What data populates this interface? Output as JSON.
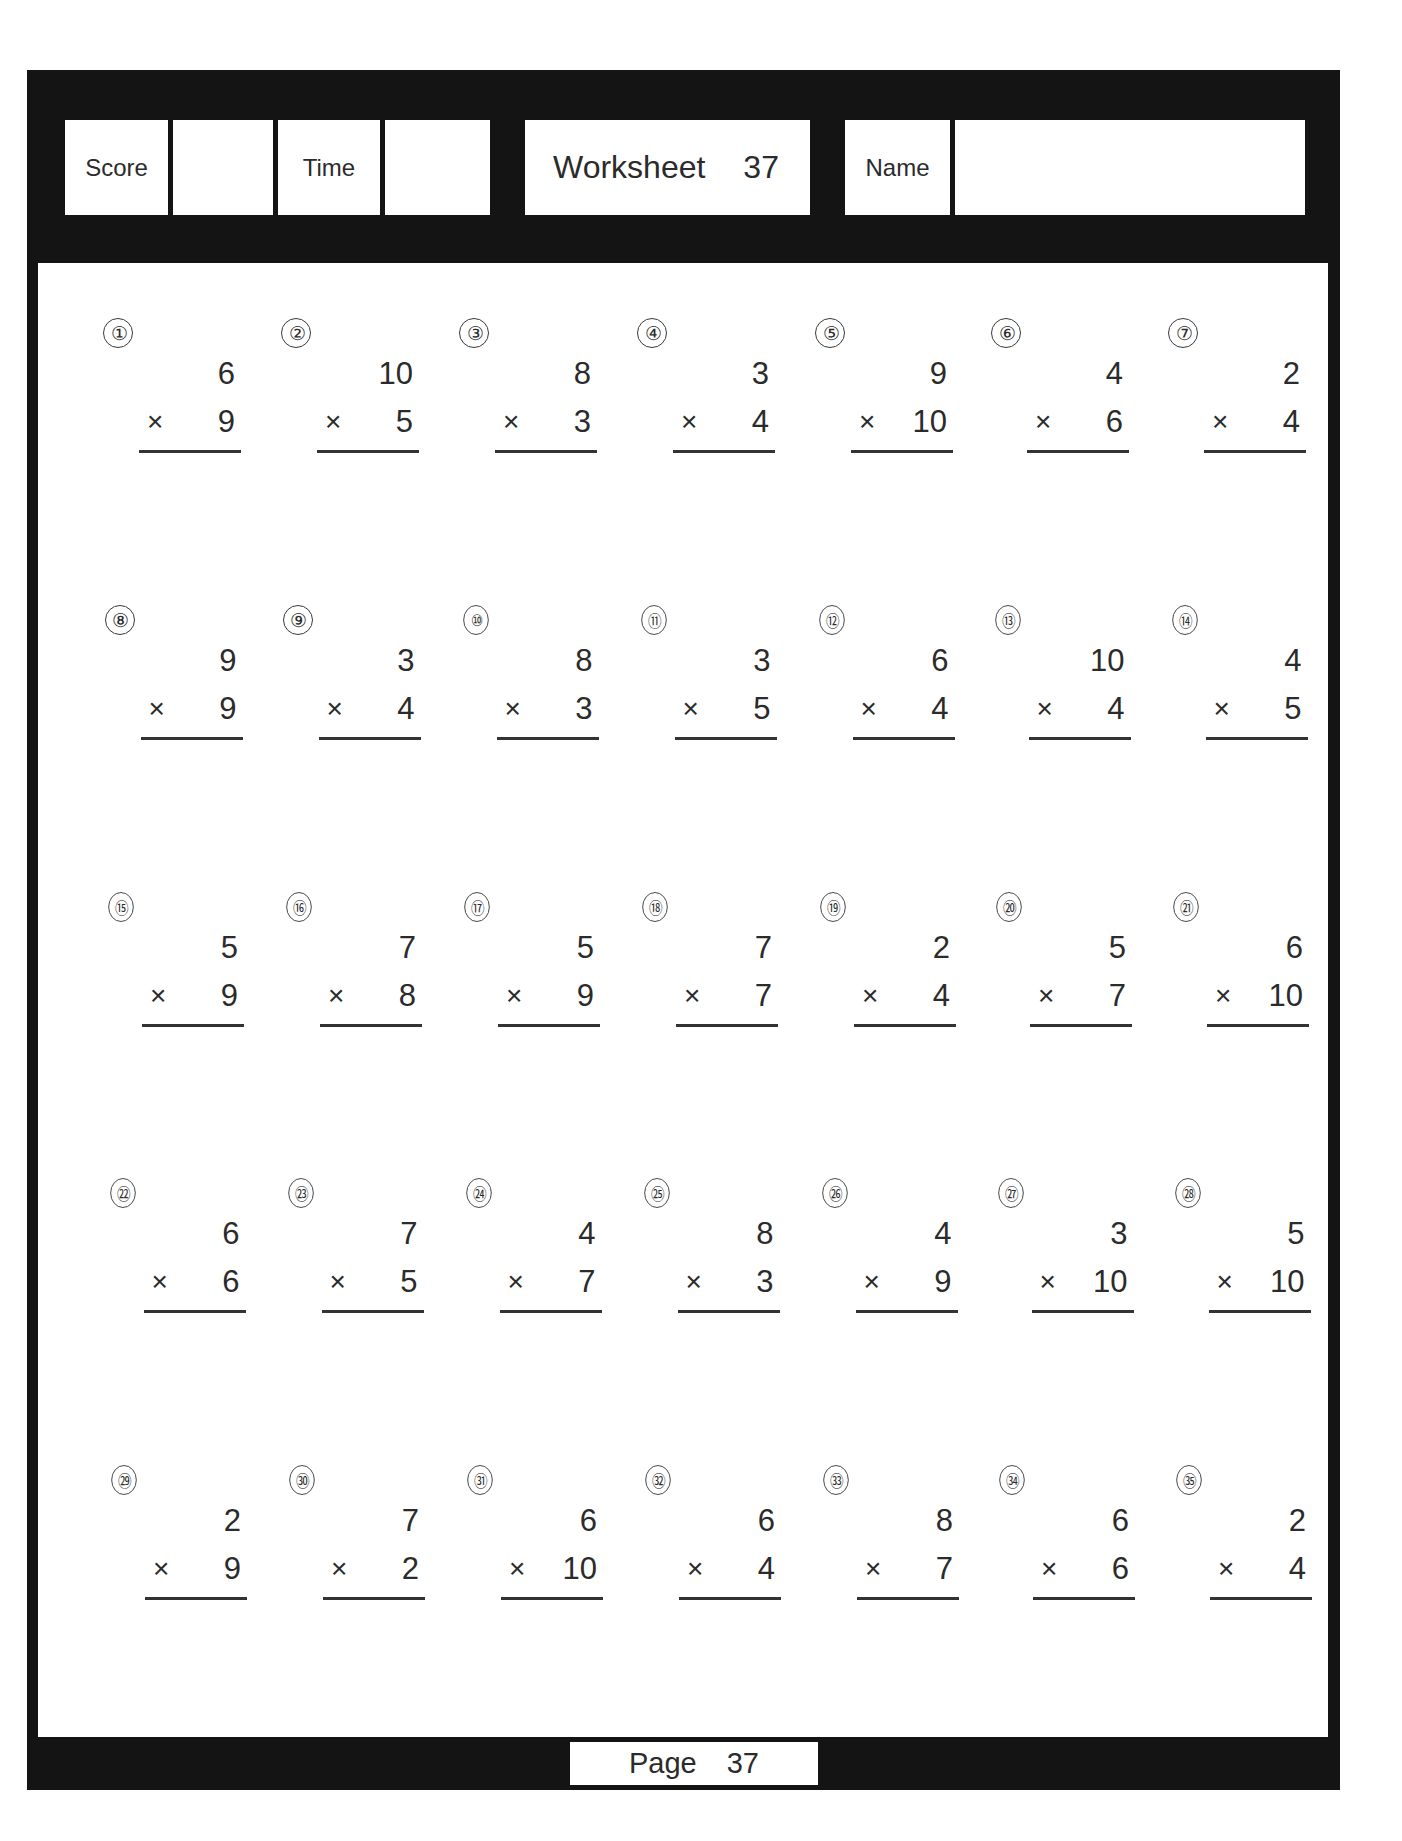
{
  "header": {
    "score_label": "Score",
    "score_value": "",
    "time_label": "Time",
    "time_value": "",
    "worksheet_label": "Worksheet",
    "worksheet_number": "37",
    "name_label": "Name",
    "name_value": ""
  },
  "footer": {
    "page_label": "Page",
    "page_number": "37"
  },
  "operator": "×",
  "problems": [
    {
      "label": "①",
      "top": "6",
      "bottom": "9"
    },
    {
      "label": "②",
      "top": "10",
      "bottom": "5"
    },
    {
      "label": "③",
      "top": "8",
      "bottom": "3"
    },
    {
      "label": "④",
      "top": "3",
      "bottom": "4"
    },
    {
      "label": "⑤",
      "top": "9",
      "bottom": "10"
    },
    {
      "label": "⑥",
      "top": "4",
      "bottom": "6"
    },
    {
      "label": "⑦",
      "top": "2",
      "bottom": "4"
    },
    {
      "label": "⑧",
      "top": "9",
      "bottom": "9"
    },
    {
      "label": "⑨",
      "top": "3",
      "bottom": "4"
    },
    {
      "label": "⑩",
      "top": "8",
      "bottom": "3"
    },
    {
      "label": "⑪",
      "top": "3",
      "bottom": "5"
    },
    {
      "label": "⑫",
      "top": "6",
      "bottom": "4"
    },
    {
      "label": "⑬",
      "top": "10",
      "bottom": "4"
    },
    {
      "label": "⑭",
      "top": "4",
      "bottom": "5"
    },
    {
      "label": "⑮",
      "top": "5",
      "bottom": "9"
    },
    {
      "label": "⑯",
      "top": "7",
      "bottom": "8"
    },
    {
      "label": "⑰",
      "top": "5",
      "bottom": "9"
    },
    {
      "label": "⑱",
      "top": "7",
      "bottom": "7"
    },
    {
      "label": "⑲",
      "top": "2",
      "bottom": "4"
    },
    {
      "label": "⑳",
      "top": "5",
      "bottom": "7"
    },
    {
      "label": "㉑",
      "top": "6",
      "bottom": "10"
    },
    {
      "label": "㉒",
      "top": "6",
      "bottom": "6"
    },
    {
      "label": "㉓",
      "top": "7",
      "bottom": "5"
    },
    {
      "label": "㉔",
      "top": "4",
      "bottom": "7"
    },
    {
      "label": "㉕",
      "top": "8",
      "bottom": "3"
    },
    {
      "label": "㉖",
      "top": "4",
      "bottom": "9"
    },
    {
      "label": "㉗",
      "top": "3",
      "bottom": "10"
    },
    {
      "label": "㉘",
      "top": "5",
      "bottom": "10"
    },
    {
      "label": "㉙",
      "top": "2",
      "bottom": "9"
    },
    {
      "label": "㉚",
      "top": "7",
      "bottom": "2"
    },
    {
      "label": "㉛",
      "top": "6",
      "bottom": "10"
    },
    {
      "label": "㉜",
      "top": "6",
      "bottom": "4"
    },
    {
      "label": "㉝",
      "top": "8",
      "bottom": "7"
    },
    {
      "label": "㉞",
      "top": "6",
      "bottom": "6"
    },
    {
      "label": "㉟",
      "top": "2",
      "bottom": "4"
    }
  ]
}
